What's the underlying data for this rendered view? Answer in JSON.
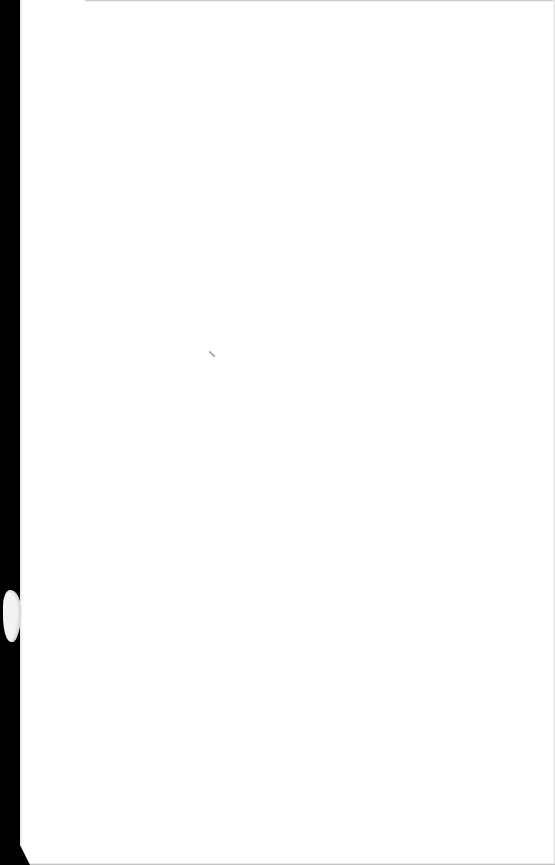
{
  "document": {
    "type": "blank scanned page",
    "text": "",
    "marks": [
      "scanner-edge-left",
      "torn-notch-left",
      "speck"
    ]
  },
  "colors": {
    "paper": "#ffffff",
    "scanner_edge": "#000000"
  }
}
